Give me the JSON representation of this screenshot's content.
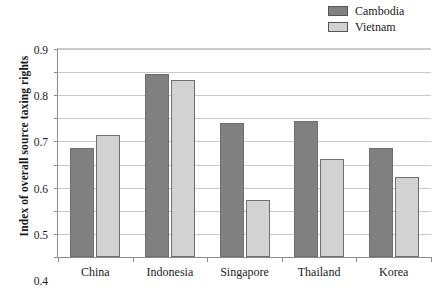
{
  "chart_data": {
    "type": "bar",
    "title": "",
    "xlabel": "",
    "ylabel": "Index of overall source taxing rights",
    "categories": [
      "China",
      "Indonesia",
      "Singapore",
      "Thailand",
      "Korea"
    ],
    "series": [
      {
        "name": "Cambodia",
        "color": "#808080",
        "values": [
          0.47,
          0.79,
          0.58,
          0.59,
          0.47
        ]
      },
      {
        "name": "Vietnam",
        "color": "#d2d2d2",
        "values": [
          0.53,
          0.765,
          0.245,
          0.425,
          0.345
        ]
      }
    ],
    "ylim": [
      0,
      0.9
    ],
    "ytick_labels": [
      "0.9",
      "0.8",
      "0.7",
      "0.6",
      "0.5",
      "0.4",
      "0.3",
      "0.2",
      "0.1",
      "0"
    ],
    "ytick_values": [
      0.9,
      0.8,
      0.7,
      0.6,
      0.5,
      0.4,
      0.3,
      0.2,
      0.1,
      0
    ],
    "grid": true,
    "legend_position": "top-right"
  },
  "legend": {
    "entries": [
      {
        "label": "Cambodia"
      },
      {
        "label": "Vietnam"
      }
    ]
  }
}
